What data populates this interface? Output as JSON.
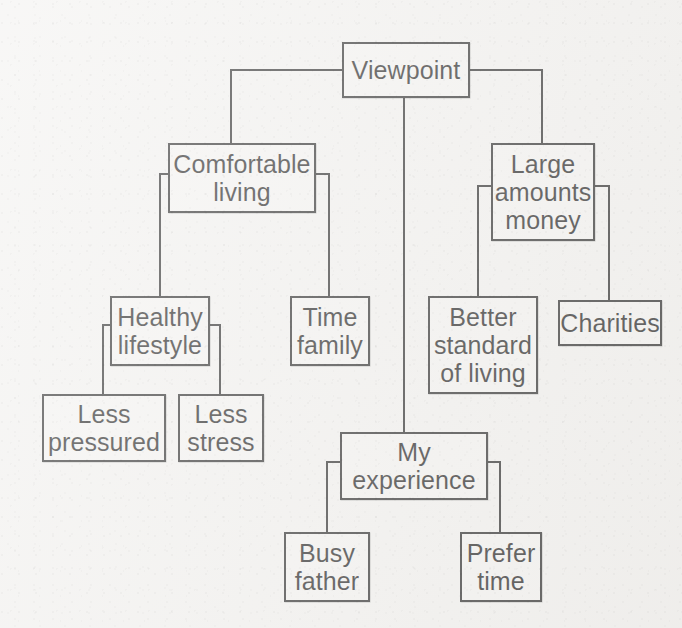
{
  "diagram": {
    "type": "tree-mind-map",
    "title_node": "Viewpoint",
    "background_color": "#f2f1ef",
    "line_color": "#1d1d1d",
    "box_fill_color": "#f4f3f1",
    "nodes": [
      {
        "id": "viewpoint",
        "label": "Viewpoint",
        "x": 342,
        "y": 42,
        "w": 128,
        "h": 56,
        "lines": [
          "Viewpoint"
        ]
      },
      {
        "id": "comfort",
        "label": "Comfortable living",
        "x": 168,
        "y": 143,
        "w": 148,
        "h": 70,
        "lines": [
          "Comfortable",
          "living"
        ]
      },
      {
        "id": "large",
        "label": "Large amounts money",
        "x": 491,
        "y": 143,
        "w": 104,
        "h": 98,
        "lines": [
          "Large",
          "amounts",
          "money"
        ]
      },
      {
        "id": "healthy",
        "label": "Healthy lifestyle",
        "x": 110,
        "y": 296,
        "w": 100,
        "h": 70,
        "lines": [
          "Healthy",
          "lifestyle"
        ]
      },
      {
        "id": "timefamily",
        "label": "Time family",
        "x": 290,
        "y": 296,
        "w": 80,
        "h": 70,
        "lines": [
          "Time",
          "family"
        ]
      },
      {
        "id": "better",
        "label": "Better standard of living",
        "x": 428,
        "y": 296,
        "w": 110,
        "h": 98,
        "lines": [
          "Better",
          "standard",
          "of living"
        ]
      },
      {
        "id": "charities",
        "label": "Charities",
        "x": 558,
        "y": 300,
        "w": 104,
        "h": 46,
        "lines": [
          "Charities"
        ]
      },
      {
        "id": "lesspress",
        "label": "Less pressured",
        "x": 42,
        "y": 394,
        "w": 124,
        "h": 68,
        "lines": [
          "Less",
          "pressured"
        ]
      },
      {
        "id": "lessstress",
        "label": "Less stress",
        "x": 178,
        "y": 394,
        "w": 86,
        "h": 68,
        "lines": [
          "Less",
          "stress"
        ]
      },
      {
        "id": "myexp",
        "label": "My experience",
        "x": 340,
        "y": 432,
        "w": 148,
        "h": 68,
        "lines": [
          "My",
          "experience"
        ]
      },
      {
        "id": "busyfather",
        "label": "Busy father",
        "x": 284,
        "y": 532,
        "w": 86,
        "h": 70,
        "lines": [
          "Busy",
          "father"
        ]
      },
      {
        "id": "prefertime",
        "label": "Prefer time",
        "x": 460,
        "y": 532,
        "w": 82,
        "h": 70,
        "lines": [
          "Prefer",
          "time"
        ]
      }
    ],
    "edges": [
      {
        "from": "viewpoint",
        "to": "comfort",
        "style": "left-elbow"
      },
      {
        "from": "viewpoint",
        "to": "large",
        "style": "right-elbow"
      },
      {
        "from": "viewpoint",
        "to": "myexp",
        "style": "vertical"
      },
      {
        "from": "comfort",
        "to": "healthy",
        "style": "left-elbow"
      },
      {
        "from": "comfort",
        "to": "timefamily",
        "style": "right-elbow"
      },
      {
        "from": "large",
        "to": "better",
        "style": "left-elbow"
      },
      {
        "from": "large",
        "to": "charities",
        "style": "right-elbow"
      },
      {
        "from": "healthy",
        "to": "lesspress",
        "style": "left-elbow"
      },
      {
        "from": "healthy",
        "to": "lessstress",
        "style": "right-elbow"
      },
      {
        "from": "myexp",
        "to": "busyfather",
        "style": "left-elbow"
      },
      {
        "from": "myexp",
        "to": "prefertime",
        "style": "right-elbow"
      }
    ]
  }
}
